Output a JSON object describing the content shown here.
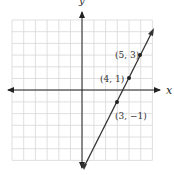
{
  "chart_data": {
    "type": "line",
    "title": "",
    "xlabel": "x",
    "ylabel": "y",
    "xlim": [
      -6,
      6
    ],
    "ylim": [
      -6,
      6
    ],
    "grid": true,
    "series": [
      {
        "name": "line",
        "equation": "y = 2x - 7",
        "x": [
          0,
          6
        ],
        "y": [
          -7,
          5
        ]
      }
    ],
    "points": [
      {
        "x": 5,
        "y": 3,
        "label": "(5, 3)"
      },
      {
        "x": 4,
        "y": 1,
        "label": "(4, 1)"
      },
      {
        "x": 3,
        "y": -1,
        "label": "(3, −1)"
      }
    ]
  },
  "axes": {
    "x_label": "x",
    "y_label": "y"
  },
  "labels": {
    "p1": "(5, 3)",
    "p2": "(4, 1)",
    "p3": "(3, −1)"
  }
}
